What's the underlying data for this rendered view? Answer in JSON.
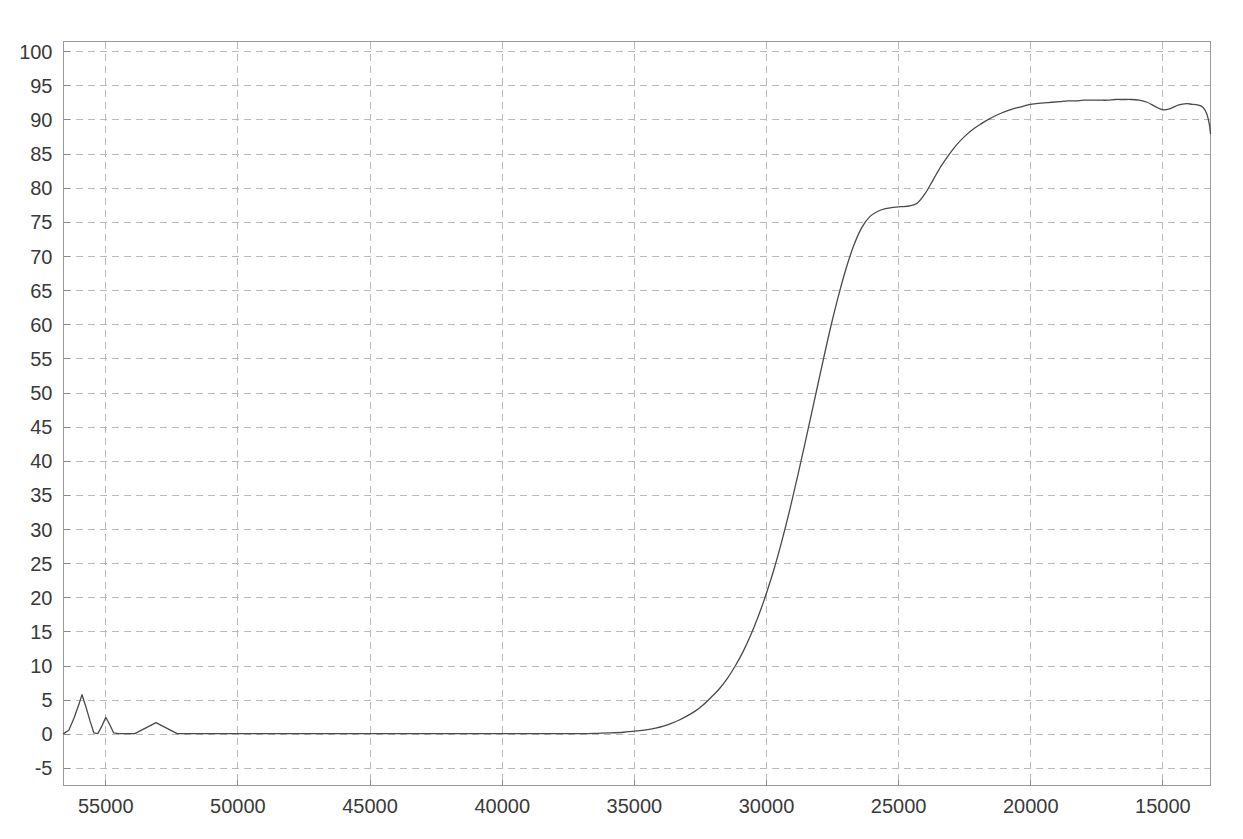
{
  "chart_data": {
    "type": "line",
    "title": "",
    "subtitle": "",
    "xlabel": "",
    "ylabel": "",
    "xlim": [
      56600,
      13200
    ],
    "ylim": [
      -7.5,
      101.5
    ],
    "x_reversed": true,
    "grid": true,
    "legend": null,
    "x_ticks": [
      55000,
      50000,
      45000,
      40000,
      35000,
      30000,
      25000,
      20000,
      15000
    ],
    "x_tick_labels": [
      "55000",
      "50000",
      "45000",
      "40000",
      "35000",
      "30000",
      "25000",
      "20000",
      "15000"
    ],
    "y_ticks": [
      -5,
      0,
      5,
      10,
      15,
      20,
      25,
      30,
      35,
      40,
      45,
      50,
      55,
      60,
      65,
      70,
      75,
      80,
      85,
      90,
      95,
      100
    ],
    "y_tick_labels": [
      "-5",
      "0",
      "5",
      "10",
      "15",
      "20",
      "25",
      "30",
      "35",
      "40",
      "45",
      "50",
      "55",
      "60",
      "65",
      "70",
      "75",
      "80",
      "85",
      "90",
      "95",
      "100"
    ],
    "series": [
      {
        "name": "transmittance",
        "color": "#4a4a4a",
        "x": [
          56600,
          56400,
          56200,
          56000,
          55900,
          55750,
          55600,
          55450,
          55300,
          55150,
          55000,
          54850,
          54700,
          54500,
          54200,
          53900,
          53500,
          53100,
          52700,
          52300,
          51900,
          51400,
          50900,
          50400,
          49900,
          49400,
          48900,
          48400,
          47900,
          47400,
          46900,
          46400,
          45900,
          45400,
          44900,
          44400,
          43900,
          43400,
          42900,
          42400,
          41900,
          41400,
          40900,
          40400,
          39900,
          39400,
          38900,
          38400,
          37900,
          37400,
          36900,
          36400,
          35900,
          35400,
          34900,
          34500,
          34200,
          33900,
          33600,
          33300,
          33000,
          32700,
          32400,
          32100,
          31800,
          31500,
          31200,
          30900,
          30600,
          30300,
          30000,
          29700,
          29400,
          29100,
          28800,
          28500,
          28200,
          27900,
          27600,
          27300,
          27000,
          26700,
          26400,
          26100,
          25800,
          25500,
          25200,
          24900,
          24600,
          24300,
          24000,
          23700,
          23400,
          23100,
          22800,
          22500,
          22200,
          21900,
          21600,
          21300,
          21000,
          20700,
          20400,
          20100,
          19800,
          19500,
          19200,
          18900,
          18600,
          18300,
          18000,
          17700,
          17400,
          17100,
          16800,
          16500,
          16200,
          15900,
          15600,
          15300,
          15000,
          14700,
          14400,
          14100,
          13900,
          13700,
          13500,
          13350,
          13250,
          13200
        ],
        "y": [
          0.1,
          0.6,
          2.4,
          4.6,
          5.8,
          4.0,
          2.0,
          0.2,
          0.1,
          1.2,
          2.5,
          1.4,
          0.2,
          0.1,
          0.1,
          0.1,
          0.9,
          1.7,
          0.9,
          0.1,
          0.1,
          0.1,
          0.1,
          0.1,
          0.1,
          0.1,
          0.1,
          0.1,
          0.1,
          0.1,
          0.1,
          0.1,
          0.1,
          0.1,
          0.1,
          0.1,
          0.1,
          0.1,
          0.1,
          0.1,
          0.1,
          0.1,
          0.1,
          0.1,
          0.1,
          0.1,
          0.1,
          0.1,
          0.1,
          0.1,
          0.1,
          0.15,
          0.2,
          0.3,
          0.5,
          0.7,
          0.9,
          1.2,
          1.6,
          2.1,
          2.7,
          3.4,
          4.3,
          5.4,
          6.6,
          8.1,
          9.9,
          12.0,
          14.5,
          17.4,
          20.7,
          24.4,
          28.6,
          33.2,
          38.2,
          43.4,
          48.7,
          54.0,
          59.2,
          63.9,
          68.1,
          71.6,
          74.2,
          75.8,
          76.6,
          77.0,
          77.2,
          77.3,
          77.4,
          77.8,
          79.2,
          81.2,
          83.2,
          84.9,
          86.4,
          87.6,
          88.6,
          89.4,
          90.1,
          90.7,
          91.2,
          91.6,
          91.9,
          92.2,
          92.4,
          92.5,
          92.6,
          92.7,
          92.8,
          92.8,
          92.9,
          92.9,
          92.9,
          92.9,
          93.0,
          93.0,
          93.0,
          92.9,
          92.6,
          92.0,
          91.5,
          91.7,
          92.2,
          92.4,
          92.3,
          92.2,
          91.9,
          91.0,
          89.5,
          88.0
        ]
      }
    ],
    "annotations": []
  },
  "style": {
    "background": "#ffffff",
    "grid_color": "#b9b9b9",
    "frame_color": "#9a9a9a",
    "tick_label_color": "#3a3a3a",
    "curve_color": "#4a4a4a"
  }
}
